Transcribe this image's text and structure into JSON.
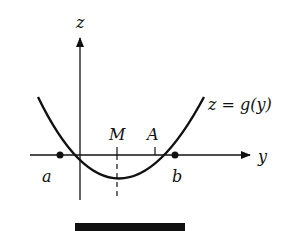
{
  "diagram": {
    "axes": {
      "vertical_label": "z",
      "horizontal_label": "y"
    },
    "curve": {
      "label": "z = g(y)"
    },
    "points": {
      "root_left": "a",
      "root_right": "b",
      "midpoint": "M",
      "point_a": "A"
    },
    "colors": {
      "ink": "#111111",
      "background": "#ffffff"
    }
  }
}
